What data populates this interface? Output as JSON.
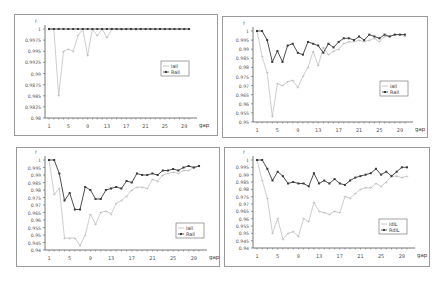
{
  "chart_data": [
    {
      "type": "line",
      "title": "",
      "xlabel": "gap",
      "ylabel": "f",
      "x": [
        1,
        2,
        3,
        4,
        5,
        6,
        7,
        8,
        9,
        10,
        11,
        12,
        13,
        14,
        15,
        16,
        17,
        18,
        19,
        20,
        21,
        22,
        23,
        24,
        25,
        26,
        27,
        28,
        29,
        30
      ],
      "xticks": [
        "1",
        "5",
        "9",
        "13",
        "17",
        "21",
        "25",
        "29"
      ],
      "yticks": [
        "1",
        "0.9975",
        "0.995",
        "0.9925",
        "0.99",
        "0.9875",
        "0.985",
        "0.9825",
        "0.98"
      ],
      "ylim": [
        0.98,
        1.0
      ],
      "grid": false,
      "legend_position": "right-middle",
      "series": [
        {
          "name": "Iall",
          "style": "light",
          "values": [
            1,
            1,
            0.985,
            0.995,
            0.9955,
            0.995,
            0.9985,
            1,
            0.994,
            1,
            0.9985,
            1,
            0.998,
            1,
            1,
            0.9998,
            1,
            1,
            0.9998,
            1,
            1,
            1,
            1,
            1,
            1,
            1,
            1,
            1,
            1,
            1
          ]
        },
        {
          "name": "Rall",
          "style": "dark",
          "values": [
            1,
            1,
            1,
            1,
            1,
            1,
            1,
            1,
            1,
            1,
            1,
            1,
            1,
            1,
            1,
            1,
            1,
            1,
            1,
            1,
            1,
            1,
            1,
            1,
            1,
            1,
            1,
            1,
            1,
            1
          ]
        }
      ]
    },
    {
      "type": "line",
      "title": "",
      "xlabel": "gap",
      "ylabel": "f",
      "x": [
        1,
        2,
        3,
        4,
        5,
        6,
        7,
        8,
        9,
        10,
        11,
        12,
        13,
        14,
        15,
        16,
        17,
        18,
        19,
        20,
        21,
        22,
        23,
        24,
        25,
        26,
        27,
        28,
        29,
        30
      ],
      "xticks": [
        "1",
        "5",
        "9",
        "13",
        "17",
        "21",
        "25",
        "29"
      ],
      "yticks": [
        "1",
        "0.995",
        "0.99",
        "0.985",
        "0.98",
        "0.975",
        "0.97",
        "0.965",
        "0.96",
        "0.955",
        "0.95"
      ],
      "ylim": [
        0.95,
        1.0
      ],
      "grid": false,
      "legend_position": "right-middle",
      "series": [
        {
          "name": "Iall",
          "style": "light",
          "values": [
            1,
            0.986,
            0.977,
            0.953,
            0.971,
            0.97,
            0.972,
            0.973,
            0.969,
            0.975,
            0.98,
            0.989,
            0.981,
            0.991,
            0.987,
            0.989,
            0.99,
            0.993,
            0.994,
            0.994,
            0.995,
            0.994,
            0.995,
            0.996,
            0.994,
            0.997,
            0.997,
            0.998,
            0.998,
            0.997
          ]
        },
        {
          "name": "Rall",
          "style": "dark",
          "values": [
            1,
            1,
            0.995,
            0.983,
            0.989,
            0.983,
            0.992,
            0.993,
            0.988,
            0.987,
            0.994,
            0.993,
            0.992,
            0.988,
            0.993,
            0.991,
            0.994,
            0.996,
            0.996,
            0.995,
            0.997,
            0.995,
            0.998,
            0.997,
            0.996,
            0.998,
            0.997,
            0.998,
            0.998,
            0.998
          ]
        }
      ]
    },
    {
      "type": "line",
      "title": "",
      "xlabel": "gap",
      "ylabel": "f",
      "x": [
        1,
        2,
        3,
        4,
        5,
        6,
        7,
        8,
        9,
        10,
        11,
        12,
        13,
        14,
        15,
        16,
        17,
        18,
        19,
        20,
        21,
        22,
        23,
        24,
        25,
        26,
        27,
        28,
        29,
        30
      ],
      "xticks": [
        "1",
        "5",
        "9",
        "13",
        "17",
        "21",
        "25",
        "29"
      ],
      "yticks": [
        "1",
        "0.995",
        "0.99",
        "0.985",
        "0.98",
        "0.975",
        "0.97",
        "0.965",
        "0.96",
        "0.955",
        "0.95",
        "0.945",
        "0.94"
      ],
      "ylim": [
        0.94,
        1.0
      ],
      "grid": false,
      "legend_position": "right-lower",
      "series": [
        {
          "name": "Iall",
          "style": "light",
          "values": [
            1,
            0.977,
            0.981,
            0.948,
            0.948,
            0.948,
            0.943,
            0.95,
            0.964,
            0.957,
            0.965,
            0.966,
            0.964,
            0.971,
            0.973,
            0.976,
            0.98,
            0.982,
            0.982,
            0.981,
            0.987,
            0.986,
            0.99,
            0.991,
            0.992,
            0.991,
            0.993,
            0.993,
            0.995,
            0.996
          ]
        },
        {
          "name": "Rall",
          "style": "dark",
          "values": [
            1,
            1,
            0.991,
            0.973,
            0.978,
            0.967,
            0.967,
            0.982,
            0.98,
            0.974,
            0.974,
            0.98,
            0.981,
            0.982,
            0.981,
            0.986,
            0.985,
            0.991,
            0.99,
            0.99,
            0.991,
            0.99,
            0.993,
            0.993,
            0.994,
            0.993,
            0.995,
            0.996,
            0.995,
            0.996
          ]
        }
      ]
    },
    {
      "type": "line",
      "title": "",
      "xlabel": "gap",
      "ylabel": "f",
      "x": [
        1,
        2,
        3,
        4,
        5,
        6,
        7,
        8,
        9,
        10,
        11,
        12,
        13,
        14,
        15,
        16,
        17,
        18,
        19,
        20,
        21,
        22,
        23,
        24,
        25,
        26,
        27,
        28,
        29,
        30
      ],
      "xticks": [
        "1",
        "5",
        "9",
        "13",
        "17",
        "21",
        "25",
        "29"
      ],
      "yticks": [
        "1",
        "0.995",
        "0.99",
        "0.985",
        "0.98",
        "0.975",
        "0.97",
        "0.965",
        "0.96",
        "0.955",
        "0.95",
        "0.945",
        "0.94"
      ],
      "ylim": [
        0.94,
        1.0
      ],
      "grid": false,
      "legend_position": "right-lower",
      "series": [
        {
          "name": "IdlL",
          "style": "light",
          "values": [
            1,
            0.986,
            0.974,
            0.95,
            0.96,
            0.946,
            0.95,
            0.951,
            0.948,
            0.96,
            0.958,
            0.971,
            0.965,
            0.964,
            0.963,
            0.965,
            0.964,
            0.975,
            0.974,
            0.977,
            0.98,
            0.981,
            0.981,
            0.984,
            0.982,
            0.985,
            0.989,
            0.989,
            0.988,
            0.989
          ]
        },
        {
          "name": "RdlL",
          "style": "dark",
          "values": [
            1,
            1,
            0.994,
            0.986,
            0.992,
            0.989,
            0.984,
            0.985,
            0.984,
            0.984,
            0.982,
            0.991,
            0.984,
            0.986,
            0.984,
            0.987,
            0.984,
            0.983,
            0.986,
            0.988,
            0.989,
            0.99,
            0.991,
            0.994,
            0.99,
            0.992,
            0.989,
            0.992,
            0.995,
            0.995
          ]
        }
      ]
    }
  ],
  "panels": [
    {
      "legend": [
        "Iall",
        "Rall"
      ],
      "ylabel": "f",
      "xlabel": "gap"
    },
    {
      "legend": [
        "Iall",
        "Rall"
      ],
      "ylabel": "f",
      "xlabel": "gap"
    },
    {
      "legend": [
        "Iall",
        "Rall"
      ],
      "ylabel": "f",
      "xlabel": "gap"
    },
    {
      "legend": [
        "IdlL",
        "RdlL"
      ],
      "ylabel": "f",
      "xlabel": "gap"
    }
  ],
  "colors": {
    "light": "#b8b8b8",
    "dark": "#3a3a3a",
    "axis": "#555555",
    "frame": "#9a9a9a"
  }
}
